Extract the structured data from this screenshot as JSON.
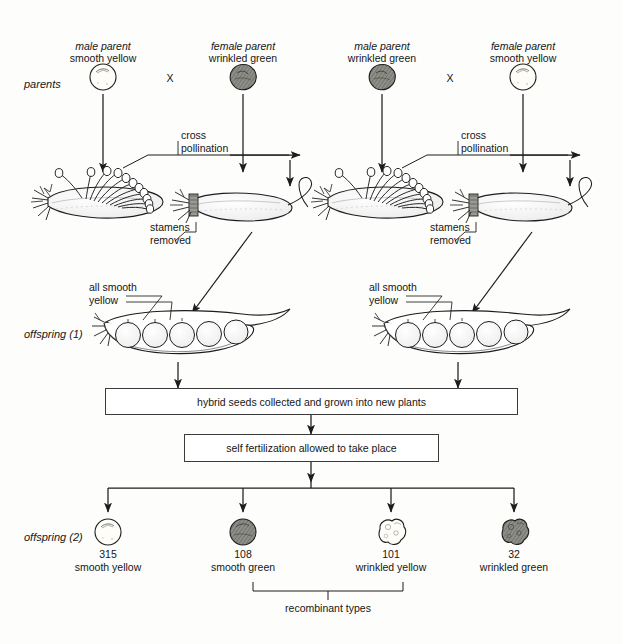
{
  "diagram": {
    "stage_labels": {
      "parents": "parents",
      "offspring1": "offspring (1)",
      "offspring2": "offspring (2)"
    },
    "crosses": [
      {
        "id": "cross-left",
        "male_parent_role": "male parent",
        "male_parent_trait": "smooth yellow",
        "male_seed_type": "smooth-yellow",
        "female_parent_role": "female parent",
        "female_parent_trait": "wrinkled green",
        "female_seed_type": "wrinkled-green",
        "cross_symbol": "X",
        "cross_pollination_label": "cross\npollination",
        "stamens_removed_label": "stamens\nremoved",
        "offspring_pod_label": "all smooth\nyellow"
      },
      {
        "id": "cross-right",
        "male_parent_role": "male parent",
        "male_parent_trait": "wrinkled green",
        "male_seed_type": "wrinkled-green",
        "female_parent_role": "female parent",
        "female_parent_trait": "smooth yellow",
        "female_seed_type": "smooth-yellow",
        "cross_symbol": "X",
        "cross_pollination_label": "cross\npollination",
        "stamens_removed_label": "stamens\nremoved",
        "offspring_pod_label": "all smooth\nyellow"
      }
    ],
    "process_boxes": [
      {
        "id": "box-hybrid-seeds",
        "text": "hybrid seeds collected and grown into new plants"
      },
      {
        "id": "box-self-fertilization",
        "text": "self fertilization allowed to take place"
      }
    ],
    "offspring2_results": [
      {
        "id": "result-smooth-yellow",
        "count": "315",
        "trait": "smooth yellow",
        "seed_type": "smooth-yellow"
      },
      {
        "id": "result-smooth-green",
        "count": "108",
        "trait": "smooth green",
        "seed_type": "smooth-green"
      },
      {
        "id": "result-wrinkled-yellow",
        "count": "101",
        "trait": "wrinkled yellow",
        "seed_type": "wrinkled-yellow"
      },
      {
        "id": "result-wrinkled-green",
        "count": "32",
        "trait": "wrinkled green",
        "seed_type": "wrinkled-green"
      }
    ],
    "recombinant_bracket_label": "recombinant types",
    "colors": {
      "ink": "#161616",
      "line": "#3b3b3b",
      "seed_light_fill": "#fefdf8",
      "seed_dark_fill": "#8c8c86",
      "paper": "#fdfdfb"
    }
  }
}
